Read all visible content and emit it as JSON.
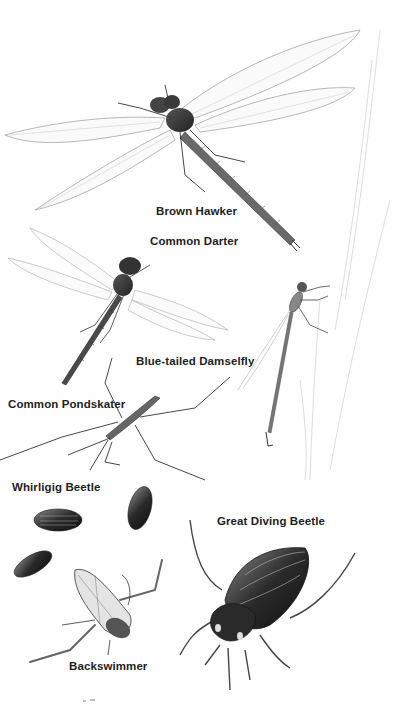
{
  "plate": {
    "description": "Illustrated plate of freshwater insects",
    "background_color": "#fefefe",
    "ink_color": "#1e1e1e",
    "labels": [
      {
        "id": "brown-hawker",
        "text": "Brown Hawker",
        "x": 156,
        "y": 205
      },
      {
        "id": "common-darter",
        "text": "Common Darter",
        "x": 150,
        "y": 235
      },
      {
        "id": "blue-tailed-damselfly",
        "text": "Blue-tailed Damselfly",
        "x": 136,
        "y": 355
      },
      {
        "id": "common-pondskater",
        "text": "Common Pondskater",
        "x": 8,
        "y": 398
      },
      {
        "id": "whirligig-beetle",
        "text": "Whirligig Beetle",
        "x": 12,
        "y": 481
      },
      {
        "id": "great-diving-beetle",
        "text": "Great Diving Beetle",
        "x": 217,
        "y": 515
      },
      {
        "id": "backswimmer",
        "text": "Backswimmer",
        "x": 69,
        "y": 660
      }
    ]
  }
}
